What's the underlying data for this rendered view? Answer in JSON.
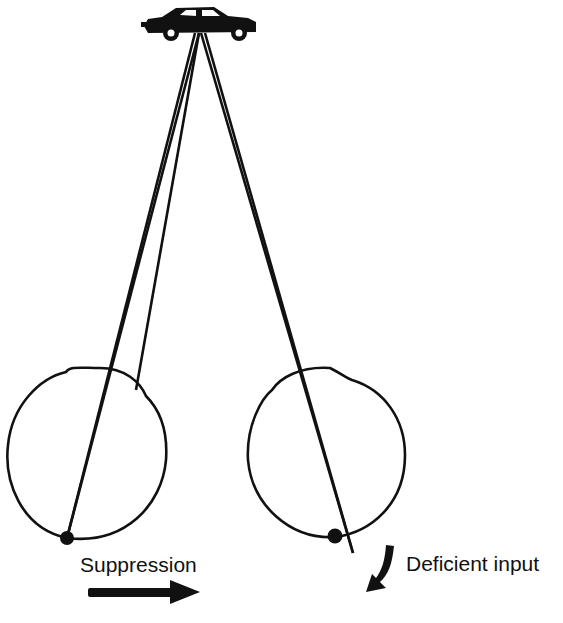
{
  "diagram": {
    "object": "car",
    "eyes": [
      {
        "id": "left-eye",
        "role": "suppressed eye",
        "focus": "fovea"
      },
      {
        "id": "right-eye",
        "role": "deviated eye",
        "focus": "off-fovea"
      }
    ],
    "labels": {
      "suppression": "Suppression",
      "deficient_input": "Deficient input"
    },
    "colors": {
      "ink": "#111111",
      "background": "#ffffff"
    }
  }
}
